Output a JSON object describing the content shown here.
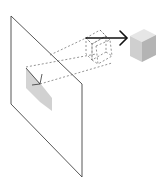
{
  "diagram": {
    "elements": [
      {
        "id": "plane",
        "type": "parallelogram-plane"
      },
      {
        "id": "projected-shadow",
        "type": "2d-projection"
      },
      {
        "id": "dashed-cube",
        "type": "wireframe-cube"
      },
      {
        "id": "arrow",
        "type": "motion-arrow"
      },
      {
        "id": "solid-cube",
        "type": "3d-cube"
      },
      {
        "id": "projection-lines",
        "type": "dashed-lines"
      }
    ],
    "colors": {
      "line": "#444444",
      "dash": "#666666",
      "arrow": "#111111",
      "cube_top": "#e6e6e6",
      "cube_left": "#d0d0d0",
      "cube_right": "#b4b4b4",
      "shadow_light": "#dcdcdc",
      "shadow_dark": "#bfbfbf"
    }
  }
}
